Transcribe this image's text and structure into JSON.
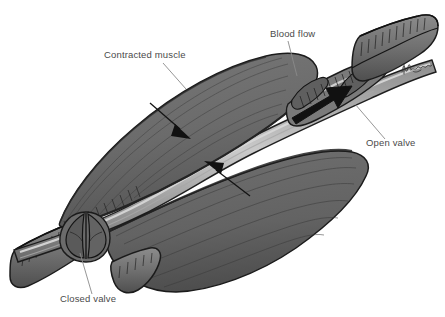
{
  "figure": {
    "background_color": "#ffffff",
    "width": 445,
    "height": 317,
    "style": "grayscale medical line illustration with stipple shading"
  },
  "palette": {
    "background": "#ffffff",
    "muscle_fill": "#6e6e6e",
    "muscle_fill_dark": "#5a5a5a",
    "muscle_shadow": "#4b4b4b",
    "vein_wall": "#7a7a7a",
    "vein_lumen": "#c9c9c9",
    "outline": "#1b1b1b",
    "arrow_black": "#111111",
    "label_text": "#4a4a4a",
    "leader_line": "#8a8a8a"
  },
  "labels": [
    {
      "id": "contracted-muscle",
      "text": "Contracted muscle",
      "x": 104,
      "y": 58,
      "anchor": "start",
      "leader": "M 163 63 L 186 89"
    },
    {
      "id": "blood-flow",
      "text": "Blood flow",
      "x": 270,
      "y": 37,
      "anchor": "start",
      "leader": "M 288 41 L 297 76"
    },
    {
      "id": "open-valve",
      "text": "Open valve",
      "x": 366,
      "y": 146,
      "anchor": "start",
      "leader": "M 385 139 L 355 104"
    },
    {
      "id": "closed-valve",
      "text": "Closed valve",
      "x": 60,
      "y": 302,
      "anchor": "start",
      "leader": "M 92 294 L 80 253"
    }
  ],
  "arrows": [
    {
      "id": "blood-flow-arrow",
      "meaning": "direction of blood flow through open valve",
      "style": "solid bold black arrow",
      "from": [
        300,
        115
      ],
      "to": [
        345,
        89
      ]
    },
    {
      "id": "muscle-compression-arrow-upper",
      "meaning": "upper muscle compressing the vein",
      "style": "thin line with solid triangular head",
      "from": [
        152,
        105
      ],
      "to": [
        188,
        136
      ]
    },
    {
      "id": "muscle-compression-arrow-lower",
      "meaning": "lower muscle compressing the vein",
      "style": "thin line with solid triangular head",
      "from": [
        248,
        194
      ],
      "to": [
        208,
        163
      ]
    }
  ],
  "structures": [
    {
      "id": "upper-muscle-belly",
      "name": "Contracted muscle (upper belly)"
    },
    {
      "id": "lower-muscle-belly",
      "name": "Contracted muscle (lower belly)"
    },
    {
      "id": "vein",
      "name": "Deep vein running between the muscles"
    },
    {
      "id": "open-valve-cusps",
      "name": "Open venous valve (cusps apart)"
    },
    {
      "id": "closed-valve-cusps",
      "name": "Closed venous valve (cusps apposed)"
    },
    {
      "id": "vein-cut-end-proximal",
      "name": "Cut proximal vein end (upper right)"
    },
    {
      "id": "vein-cut-end-distal",
      "name": "Cut distal vein end (lower left)"
    }
  ],
  "signature": {
    "id": "artist-signature",
    "description": "handwritten artist signature, illegible",
    "x": 404,
    "y": 68
  }
}
